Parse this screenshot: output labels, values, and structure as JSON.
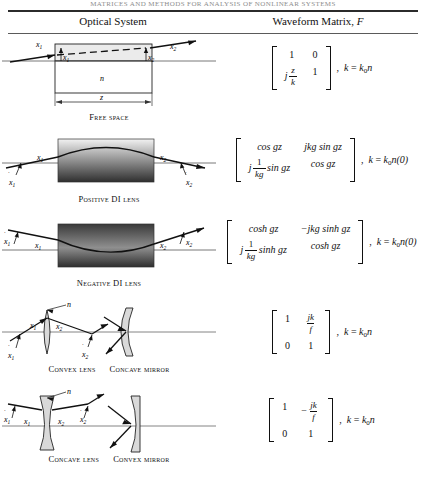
{
  "running_head": "MATRICES AND METHODS FOR ANALYSIS OF NONLINEAR SYSTEMS",
  "table": {
    "header": {
      "left": "Optical System",
      "right_prefix": "Waveform Matrix, ",
      "right_symbol": "F"
    },
    "rows": [
      {
        "id": "free-space",
        "caption": "Free space",
        "caption_lead": "F",
        "diagram": {
          "labels": {
            "x1": "x",
            "x1_sub": "1",
            "x1_dot": "x",
            "x1_dot_sub": "1",
            "x2": "x",
            "x2_sub": "2",
            "x2_dot": "x",
            "x2_dot_sub": "2",
            "index": "n",
            "length": "z"
          }
        },
        "matrix": {
          "m11": "1",
          "m12": "0",
          "m21_prefix": "j",
          "m21_num": "z",
          "m21_den": "k",
          "m22": "1",
          "condition": "k = k0n",
          "condition_base": "k",
          "condition_sub": "0",
          "condition_tail": "n"
        }
      },
      {
        "id": "positive-di-lens",
        "caption": "Positive DI lens",
        "diagram": {
          "labels": {
            "x1": "x",
            "x1_sub": "1",
            "x1_dot": "x",
            "x1_dot_sub": "1",
            "x2": "x",
            "x2_sub": "2",
            "x2_dot": "x",
            "x2_dot_sub": "2"
          },
          "gradient": "light-top-dark-bottom"
        },
        "matrix": {
          "m11": "cos gz",
          "m12": "jkg sin gz",
          "m21_prefix": "j",
          "m21_num": "1",
          "m21_den": "kg",
          "m21_tail": "sin gz",
          "m22": "cos gz",
          "condition_base": "k",
          "condition_sub": "0",
          "condition_tail": "n(0)"
        }
      },
      {
        "id": "negative-di-lens",
        "caption": "Negative DI lens",
        "diagram": {
          "labels": {
            "x1": "x",
            "x1_sub": "1",
            "x1_dot": "x",
            "x1_dot_sub": "1",
            "x2": "x",
            "x2_sub": "2",
            "x2_dot": "x",
            "x2_dot_sub": "2"
          },
          "gradient": "dark-top-light-bottom"
        },
        "matrix": {
          "m11": "cosh gz",
          "m12": "−jkg sinh gz",
          "m21_prefix": "j",
          "m21_num": "1",
          "m21_den": "kg",
          "m21_tail": "sinh gz",
          "m22": "cosh gz",
          "condition_base": "k",
          "condition_sub": "0",
          "condition_tail": "n(0)"
        }
      },
      {
        "id": "convex-lens-concave-mirror",
        "caption_left": "Convex lens",
        "caption_right": "Concave mirror",
        "diagram": {
          "labels": {
            "x1": "x",
            "x1_sub": "1",
            "x1_dot": "x",
            "x1_dot_sub": "1",
            "x2": "x",
            "x2_sub": "2",
            "x2_dot": "x",
            "x2_dot_sub": "2",
            "index": "n"
          }
        },
        "matrix": {
          "m11": "1",
          "m12_num": "jk",
          "m12_den": "f",
          "m21": "0",
          "m22": "1",
          "condition_base": "k",
          "condition_sub": "0",
          "condition_tail": "n"
        }
      },
      {
        "id": "concave-lens-convex-mirror",
        "caption_left": "Concave lens",
        "caption_right": "Convex mirror",
        "diagram": {
          "labels": {
            "x1": "x",
            "x1_sub": "1",
            "x1_dot": "x",
            "x1_dot_sub": "1",
            "x2": "x",
            "x2_sub": "2",
            "x2_dot": "x",
            "x2_dot_sub": "2",
            "index": "n"
          }
        },
        "matrix": {
          "m11": "1",
          "m12_sign": "−",
          "m12_num": "jk",
          "m12_den": "f",
          "m21": "0",
          "m22": "1",
          "condition_base": "k",
          "condition_sub": "0",
          "condition_tail": "n"
        }
      }
    ]
  },
  "colors": {
    "rule": "#2b2b2b",
    "text": "#111111",
    "glass_fill": "#d9d9d9",
    "box_fill": "#ebebeb"
  }
}
